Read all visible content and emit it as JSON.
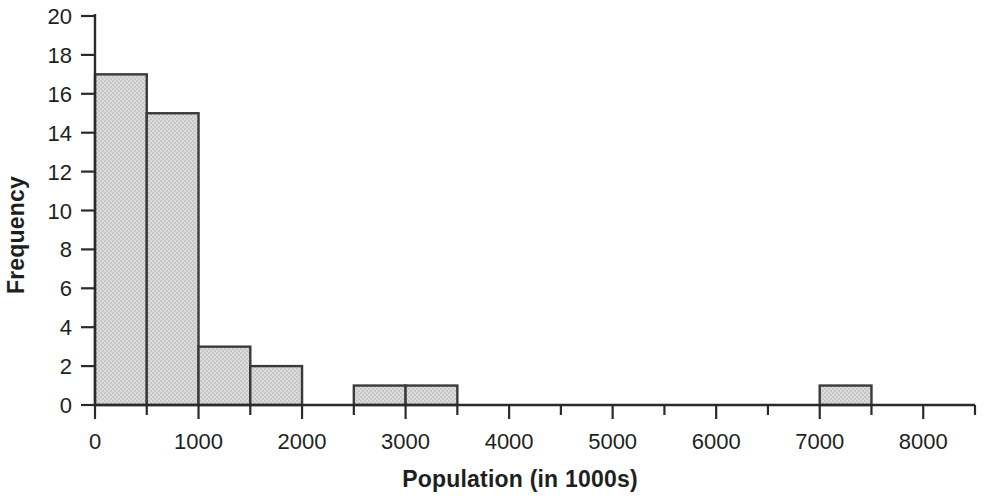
{
  "chart_data": {
    "type": "bar",
    "title": "",
    "subtitle": "",
    "xlabel": "Population (in 1000s)",
    "ylabel": "Frequency",
    "xlim": [
      0,
      8500
    ],
    "ylim": [
      0,
      20
    ],
    "grid": false,
    "legend": null,
    "bin_width": 500,
    "x_major_ticks": [
      0,
      1000,
      2000,
      3000,
      4000,
      5000,
      6000,
      7000,
      8000
    ],
    "x_major_tick_labels": [
      "0",
      "1000",
      "2000",
      "3000",
      "4000",
      "5000",
      "6000",
      "7000",
      "8000"
    ],
    "x_minor_ticks": [
      500,
      1500,
      2500,
      3500,
      4500,
      5500,
      6500,
      7500,
      8500
    ],
    "y_ticks": [
      0,
      2,
      4,
      6,
      8,
      10,
      12,
      14,
      16,
      18,
      20
    ],
    "y_tick_labels": [
      "0",
      "2",
      "4",
      "6",
      "8",
      "10",
      "12",
      "14",
      "16",
      "18",
      "20"
    ],
    "bin_edges": [
      0,
      500,
      1000,
      1500,
      2000,
      2500,
      3000,
      3500,
      4000,
      4500,
      5000,
      5500,
      6000,
      6500,
      7000,
      7500,
      8000,
      8500
    ],
    "categories": [
      "0-500",
      "500-1000",
      "1000-1500",
      "1500-2000",
      "2000-2500",
      "2500-3000",
      "3000-3500",
      "3500-4000",
      "4000-4500",
      "4500-5000",
      "5000-5500",
      "5500-6000",
      "6000-6500",
      "6500-7000",
      "7000-7500",
      "7500-8000",
      "8000-8500"
    ],
    "values": [
      17,
      15,
      3,
      2,
      0,
      1,
      1,
      0,
      0,
      0,
      0,
      0,
      0,
      0,
      1,
      0,
      0
    ],
    "bars": [
      {
        "x0": 0,
        "x1": 500,
        "value": 17
      },
      {
        "x0": 500,
        "x1": 1000,
        "value": 15
      },
      {
        "x0": 1000,
        "x1": 1500,
        "value": 3
      },
      {
        "x0": 1500,
        "x1": 2000,
        "value": 2
      },
      {
        "x0": 2500,
        "x1": 3000,
        "value": 1
      },
      {
        "x0": 3000,
        "x1": 3500,
        "value": 1
      },
      {
        "x0": 7000,
        "x1": 7500,
        "value": 1
      }
    ],
    "colors": {
      "bar_fill": "#d2d2d2",
      "bar_edge": "#3a3a3a",
      "axis": "#2a2a2a",
      "text": "#1f1f1f",
      "background": "#ffffff"
    }
  }
}
